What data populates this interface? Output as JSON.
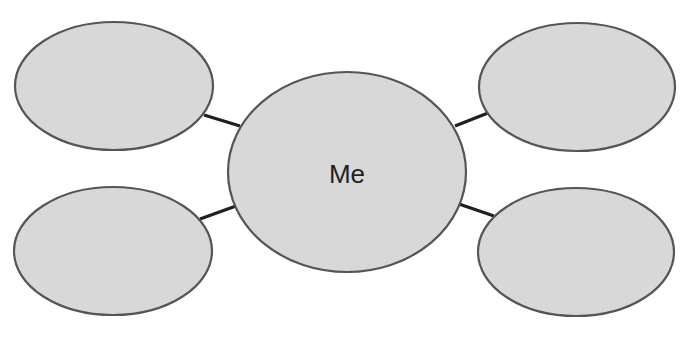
{
  "diagram": {
    "type": "mind-map",
    "center": {
      "label": "Me"
    },
    "branches": [
      {
        "position": "top-left",
        "label": ""
      },
      {
        "position": "top-right",
        "label": ""
      },
      {
        "position": "bottom-left",
        "label": ""
      },
      {
        "position": "bottom-right",
        "label": ""
      }
    ],
    "colors": {
      "bubble_fill": "#d8d8d8",
      "bubble_stroke": "#555555",
      "connector": "#1f1f1f",
      "text": "#222222"
    }
  }
}
